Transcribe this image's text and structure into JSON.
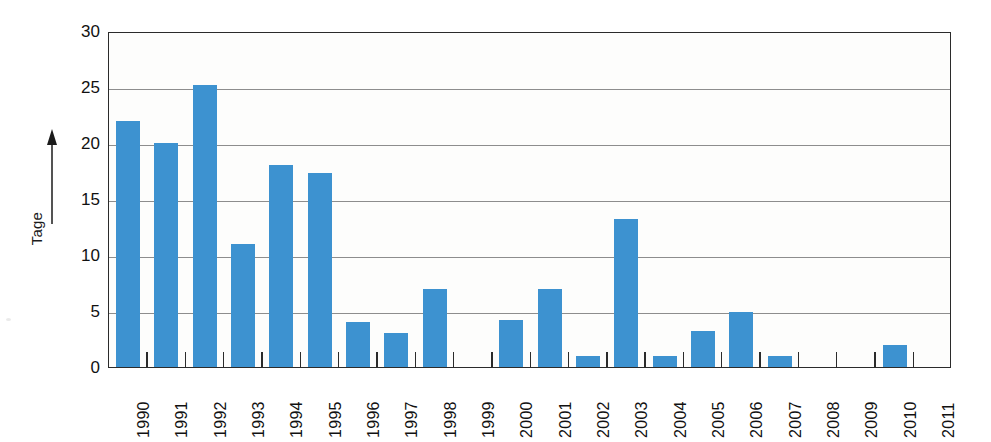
{
  "chart_data": {
    "type": "bar",
    "title": "",
    "subtitle": "",
    "xlabel": "",
    "ylabel": "Tage",
    "ylabel_arrow": "up-arrow",
    "ylim": [
      0,
      30
    ],
    "ytick_step": 5,
    "yticks": [
      0,
      5,
      10,
      15,
      20,
      25,
      30
    ],
    "ytick_labels": [
      "0",
      "5",
      "10",
      "15",
      "20",
      "25",
      "30"
    ],
    "grid": true,
    "grid_axis": "y",
    "legend": false,
    "legend_position": "none",
    "bar_color": "#3d92d0",
    "categories": [
      "1990",
      "1991",
      "1992",
      "1993",
      "1994",
      "1995",
      "1996",
      "1997",
      "1998",
      "1999",
      "2000",
      "2001",
      "2002",
      "2003",
      "2004",
      "2005",
      "2006",
      "2007",
      "2008",
      "2009",
      "2010",
      "2011"
    ],
    "values": [
      22,
      20,
      25.2,
      11,
      18,
      17.3,
      4,
      3,
      7,
      0,
      4.2,
      7,
      1,
      13.2,
      1,
      3.2,
      4.9,
      1,
      0,
      0,
      2,
      0
    ]
  },
  "axes": {
    "y_title": "Tage",
    "frame_color": "#2b2b2b",
    "gridline_color": "#8d8d8d",
    "plot_background": "#fdfdfc"
  }
}
